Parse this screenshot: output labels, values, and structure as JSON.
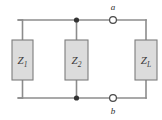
{
  "figure": {
    "name": "two-port-impedance-network",
    "background_color": "#ffffff",
    "wire_color": "#8c8c8c",
    "wire_width": 1.6,
    "box_fill": "#dcdcdc",
    "box_stroke": "#7d7d7d",
    "node_color": "#333333",
    "terminal_fill": "#ffffff",
    "terminal_stroke": "#4a4a4a"
  },
  "rails": {
    "top_y": 20,
    "bottom_y": 98,
    "left_x": 18,
    "right_x": 146
  },
  "components": [
    {
      "id": "z1",
      "symbol": "Z",
      "subscript": "1",
      "x": 12,
      "y": 40,
      "width": 21,
      "height": 40,
      "branch_x": 22.5
    },
    {
      "id": "z2",
      "symbol": "Z",
      "subscript": "2",
      "x": 65,
      "y": 40,
      "width": 23,
      "height": 40,
      "branch_x": 76.5
    },
    {
      "id": "zl",
      "symbol": "Z",
      "subscript": "L",
      "x": 135,
      "y": 40,
      "width": 22,
      "height": 40,
      "branch_x": 146
    }
  ],
  "junction_nodes": [
    {
      "id": "node-top",
      "x": 76.5,
      "y": 20,
      "radius": 2.6
    },
    {
      "id": "node-bottom",
      "x": 76.5,
      "y": 98,
      "radius": 2.6
    }
  ],
  "terminals": [
    {
      "id": "terminal-a",
      "label": "a",
      "x": 113,
      "y": 20,
      "radius": 3.4,
      "label_x": 113,
      "label_y": 10
    },
    {
      "id": "terminal-b",
      "label": "b",
      "x": 113,
      "y": 98,
      "radius": 3.4,
      "label_x": 113,
      "label_y": 114
    }
  ]
}
